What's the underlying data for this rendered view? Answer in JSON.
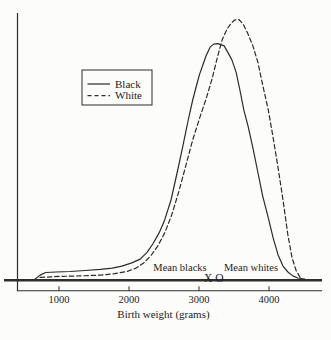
{
  "figure": {
    "ink_color": "#2b2b2b",
    "background_color": "#fcfcfb"
  },
  "chart_data": {
    "type": "line",
    "title": "",
    "xlabel": "Birth weight (grams)",
    "ylabel": "",
    "x_ticks": [
      1000,
      2000,
      3000,
      4000
    ],
    "x_range_grams": [
      400,
      4760
    ],
    "y_axis_note": "relative frequency, unlabeled axis",
    "grid": false,
    "legend_position": "upper-left-box",
    "legend_entries": [
      "Black",
      "White"
    ],
    "series": [
      {
        "name": "Black",
        "line_style": "solid",
        "color": "#2b2b2b",
        "points": [
          [
            660,
            0
          ],
          [
            730,
            0.015
          ],
          [
            810,
            0.025
          ],
          [
            960,
            0.027
          ],
          [
            1160,
            0.029
          ],
          [
            1370,
            0.033
          ],
          [
            1590,
            0.037
          ],
          [
            1760,
            0.042
          ],
          [
            1900,
            0.05
          ],
          [
            2040,
            0.062
          ],
          [
            2160,
            0.077
          ],
          [
            2260,
            0.104
          ],
          [
            2340,
            0.135
          ],
          [
            2430,
            0.178
          ],
          [
            2510,
            0.228
          ],
          [
            2600,
            0.305
          ],
          [
            2690,
            0.413
          ],
          [
            2770,
            0.514
          ],
          [
            2840,
            0.606
          ],
          [
            2910,
            0.691
          ],
          [
            2970,
            0.753
          ],
          [
            3010,
            0.792
          ],
          [
            3060,
            0.83
          ],
          [
            3100,
            0.861
          ],
          [
            3160,
            0.896
          ],
          [
            3210,
            0.907
          ],
          [
            3270,
            0.909
          ],
          [
            3310,
            0.905
          ],
          [
            3360,
            0.9
          ],
          [
            3410,
            0.876
          ],
          [
            3470,
            0.846
          ],
          [
            3530,
            0.799
          ],
          [
            3590,
            0.722
          ],
          [
            3640,
            0.653
          ],
          [
            3700,
            0.591
          ],
          [
            3770,
            0.506
          ],
          [
            3840,
            0.413
          ],
          [
            3910,
            0.32
          ],
          [
            3990,
            0.236
          ],
          [
            4060,
            0.158
          ],
          [
            4130,
            0.093
          ],
          [
            4200,
            0.05
          ],
          [
            4270,
            0.027
          ],
          [
            4340,
            0.012
          ],
          [
            4410,
            0.004
          ],
          [
            4510,
            0
          ]
        ]
      },
      {
        "name": "White",
        "line_style": "dashed",
        "color": "#2b2b2b",
        "points": [
          [
            730,
            0.006
          ],
          [
            1010,
            0.01
          ],
          [
            1300,
            0.012
          ],
          [
            1590,
            0.015
          ],
          [
            1800,
            0.021
          ],
          [
            1970,
            0.029
          ],
          [
            2100,
            0.042
          ],
          [
            2210,
            0.062
          ],
          [
            2310,
            0.089
          ],
          [
            2410,
            0.127
          ],
          [
            2510,
            0.178
          ],
          [
            2610,
            0.247
          ],
          [
            2710,
            0.336
          ],
          [
            2810,
            0.436
          ],
          [
            2910,
            0.537
          ],
          [
            3010,
            0.622
          ],
          [
            3110,
            0.703
          ],
          [
            3190,
            0.776
          ],
          [
            3260,
            0.853
          ],
          [
            3330,
            0.923
          ],
          [
            3400,
            0.965
          ],
          [
            3460,
            0.988
          ],
          [
            3510,
            1.0
          ],
          [
            3570,
            1.002
          ],
          [
            3630,
            0.985
          ],
          [
            3700,
            0.946
          ],
          [
            3770,
            0.9
          ],
          [
            3840,
            0.838
          ],
          [
            3910,
            0.749
          ],
          [
            3990,
            0.653
          ],
          [
            4060,
            0.544
          ],
          [
            4130,
            0.429
          ],
          [
            4200,
            0.305
          ],
          [
            4270,
            0.17
          ],
          [
            4330,
            0.081
          ],
          [
            4390,
            0.031
          ],
          [
            4440,
            0.008
          ],
          [
            4470,
            0.002
          ]
        ]
      }
    ],
    "annotations": [
      {
        "label": "Mean blacks",
        "marker": "X",
        "grams": 3130
      },
      {
        "label": "Mean whites",
        "marker": "O",
        "grams": 3290
      }
    ]
  }
}
